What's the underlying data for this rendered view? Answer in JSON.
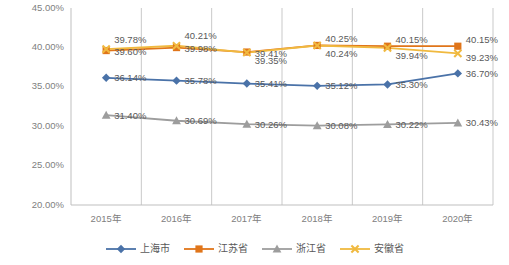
{
  "chart_data": {
    "type": "line",
    "title": "",
    "subtitle": "",
    "xlabel": "",
    "ylabel": "",
    "categories": [
      "2015年",
      "2016年",
      "2017年",
      "2018年",
      "2019年",
      "2020年"
    ],
    "ylim": [
      20.0,
      45.0
    ],
    "ytick_labels": [
      "45.00%",
      "40.00%",
      "35.00%",
      "30.00%",
      "25.00%",
      "20.00%"
    ],
    "ytick_values": [
      45.0,
      40.0,
      35.0,
      30.0,
      25.0,
      20.0
    ],
    "grid": {
      "horizontal": false,
      "vertical": true
    },
    "legend_position": "bottom",
    "value_suffix": "%",
    "series": [
      {
        "name": "上海市",
        "color": "#4a72a8",
        "marker": "diamond",
        "values": [
          36.14,
          35.78,
          35.41,
          35.12,
          35.3,
          36.7
        ],
        "labels": [
          "36.14%",
          "35.78%",
          "35.41%",
          "35.12%",
          "35.30%",
          "36.70%"
        ]
      },
      {
        "name": "江苏省",
        "color": "#e0751a",
        "marker": "square",
        "values": [
          39.6,
          39.98,
          39.41,
          40.25,
          40.15,
          40.15
        ],
        "labels": [
          "39.60%",
          "39.98%",
          "39.41%",
          "40.25%",
          "40.15%",
          "40.15%"
        ]
      },
      {
        "name": "浙江省",
        "color": "#9d9d9d",
        "marker": "triangle",
        "values": [
          31.4,
          30.69,
          30.26,
          30.08,
          30.22,
          30.43
        ],
        "labels": [
          "31.40%",
          "30.69%",
          "30.26%",
          "30.08%",
          "30.22%",
          "30.43%"
        ]
      },
      {
        "name": "安徽省",
        "color": "#f0b93f",
        "marker": "cross",
        "values": [
          39.78,
          40.21,
          39.35,
          40.24,
          39.94,
          39.23
        ],
        "labels": [
          "39.78%",
          "40.21%",
          "39.35%",
          "40.24%",
          "39.94%",
          "39.23%"
        ]
      }
    ]
  }
}
